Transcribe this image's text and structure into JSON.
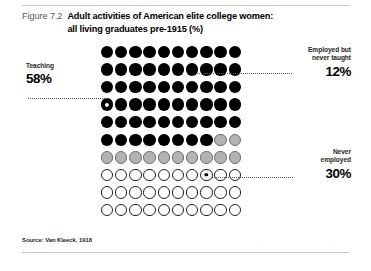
{
  "figure": {
    "number": "Figure 7.2",
    "title_line1": "Adult activities of American elite college women:",
    "title_line2": "all living graduates pre-1915 (%)",
    "source": "Source: Van Kleeck, 1918",
    "folio_left": "·",
    "folio_right": "·"
  },
  "callouts": {
    "teaching": {
      "label": "Teaching",
      "value": "58%"
    },
    "employed": {
      "label_line1": "Employed but",
      "label_line2": "never taught",
      "value": "12%"
    },
    "never": {
      "label_line1": "Never",
      "label_line2": "employed",
      "value": "30%"
    }
  },
  "colors": {
    "teaching": "#000000",
    "employed": "#b3b3b3",
    "never_employed": "#ffffff",
    "outline": "#231f20",
    "leader_line": "#58595b",
    "figure_number": "#58595b"
  },
  "chart_data": {
    "type": "pie",
    "title": "Adult activities of American elite college women: all living graduates pre-1915 (%)",
    "subtitle": "Figure 7.2",
    "xlabel": "",
    "ylabel": "",
    "grid": false,
    "legend_position": "callouts",
    "unit": "1 dot = 1% of graduates",
    "total_dots": 100,
    "grid_rows": 10,
    "grid_cols": 10,
    "fill_order": "row-major",
    "categories": [
      "Teaching",
      "Employed but never taught",
      "Never employed"
    ],
    "values": [
      58,
      12,
      30
    ],
    "slice_colors": [
      "#000000",
      "#b3b3b3",
      "#ffffff"
    ],
    "annotations": [
      "Teaching 58%",
      "Employed but never taught 12%",
      "Never employed 30%",
      "Source: Van Kleeck, 1918"
    ]
  }
}
